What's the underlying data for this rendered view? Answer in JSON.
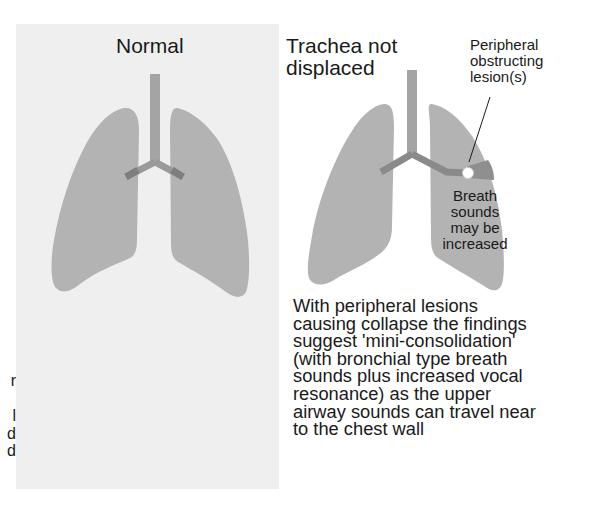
{
  "figure": {
    "left_panel": {
      "title": "Normal",
      "background": "#efefef"
    },
    "right_panel": {
      "title": "Trachea not displaced",
      "title_lines": [
        "Trachea not",
        "displaced"
      ],
      "lesion_label_lines": [
        "Peripheral",
        "obstructing",
        "lesion(s)"
      ],
      "breath_label_lines": [
        "Breath",
        "sounds",
        "may be",
        "increased"
      ],
      "caption_lines": [
        "With peripheral lesions",
        "causing collapse the findings",
        "suggest 'mini-consolidation'",
        "(with bronchial type breath",
        "sounds plus increased vocal",
        "resonance) as the upper",
        "airway sounds can travel near",
        "to the chest wall"
      ]
    },
    "cropped_edge_text": [
      "r",
      "",
      "l",
      "d",
      "d"
    ],
    "colors": {
      "lung": "#b3b3b3",
      "trachea": "#9e9e9e",
      "bronchus": "#8a8a8a",
      "collapse_zone": "#8f8f8f",
      "lesion": "#ffffff",
      "text": "#1a1a1a"
    }
  }
}
